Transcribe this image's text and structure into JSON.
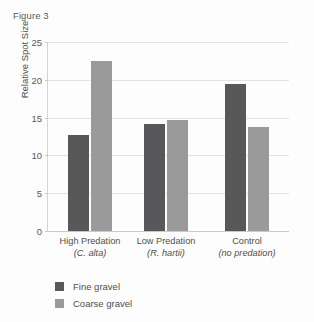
{
  "figure": {
    "label": "Figure 3"
  },
  "chart_data": {
    "type": "bar",
    "title": "Figure 3",
    "xlabel": "",
    "ylabel": "Relative Spot Size",
    "ylim": [
      0,
      25
    ],
    "yticks": [
      "0",
      "5",
      "10",
      "15",
      "20",
      "25"
    ],
    "grid": true,
    "legend_position": "below-left",
    "categories": [
      "High Predation\n(C. alta)",
      "Low Predation\n(R. hartii)",
      "Control\n(no predation)"
    ],
    "category_lines": [
      {
        "main": "High Predation",
        "sub": "(C. alta)"
      },
      {
        "main": "Low Predation",
        "sub": "(R. hartii)"
      },
      {
        "main": "Control",
        "sub": "(no predation)"
      }
    ],
    "series": [
      {
        "name": "Fine gravel",
        "color": "#58585a",
        "values": [
          12.7,
          14.1,
          19.4
        ]
      },
      {
        "name": "Coarse gravel",
        "color": "#9a9a9a",
        "values": [
          22.5,
          14.7,
          13.8
        ]
      }
    ]
  },
  "legend": {
    "items": [
      {
        "label": "Fine gravel",
        "color": "#58585a"
      },
      {
        "label": "Coarse gravel",
        "color": "#9a9a9a"
      }
    ]
  },
  "colors": {
    "fine_gravel": "#58585a",
    "coarse_gravel": "#9a9a9a",
    "gridline": "#e3e3e3",
    "axis": "#c9c9c9",
    "text": "#4f4f4f"
  }
}
